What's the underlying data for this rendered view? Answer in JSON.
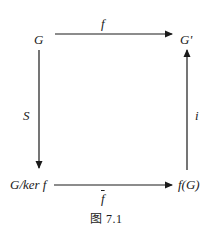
{
  "diagram": {
    "nodes": {
      "top_left": "G",
      "top_right": "G'",
      "bottom_left": "G/ker f",
      "bottom_right": "f(G)"
    },
    "arrows": {
      "top": {
        "label": "f",
        "from": "G",
        "to": "G'",
        "direction": "right"
      },
      "left": {
        "label": "S",
        "from": "G",
        "to": "G/ker f",
        "direction": "down"
      },
      "right": {
        "label": "i",
        "from": "f(G)",
        "to": "G'",
        "direction": "up"
      },
      "bottom": {
        "label": "f",
        "label_overline": true,
        "from": "G/ker f",
        "to": "f(G)",
        "direction": "right"
      }
    },
    "caption": "图 7.1",
    "colors": {
      "stroke": "#1a1a1a",
      "background": "#ffffff"
    }
  }
}
